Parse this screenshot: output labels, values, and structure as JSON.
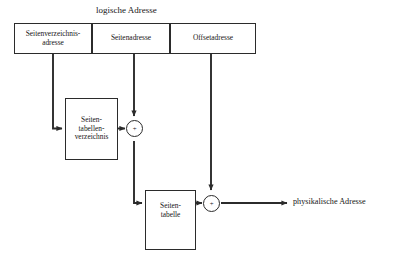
{
  "diagram": {
    "title": "logische Adresse",
    "output_label": "physikalische Adresse",
    "header_cells": [
      {
        "id": "page-directory-address",
        "line1": "Seitenverzeichnis-",
        "line2": "adresse"
      },
      {
        "id": "page-address",
        "line1": "Seitenadresse",
        "line2": ""
      },
      {
        "id": "offset-address",
        "line1": "Offsetadresse",
        "line2": ""
      }
    ],
    "memory_boxes": [
      {
        "id": "page-table-directory",
        "line1": "Seiten-",
        "line2": "tabellen-",
        "line3": "verzeichnis"
      },
      {
        "id": "page-table",
        "line1": "Seiten-",
        "line2": "tabelle",
        "line3": ""
      }
    ],
    "operators": [
      {
        "id": "adder-1",
        "symbol": "+"
      },
      {
        "id": "adder-2",
        "symbol": "+"
      }
    ],
    "colors": {
      "stroke": "#2b2b2b",
      "text": "#161616",
      "background": "#ffffff"
    }
  }
}
